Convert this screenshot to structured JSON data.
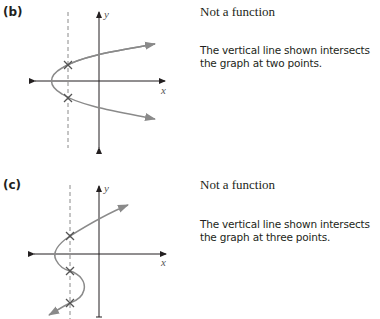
{
  "panels": [
    {
      "label": "(b)",
      "title": "Not a function",
      "description": "The vertical line shown intersects the graph at two points.",
      "axis_labels": {
        "x": "x",
        "y": "y"
      },
      "intersection_count": 2
    },
    {
      "label": "(c)",
      "title": "Not a function",
      "description": "The vertical line shown intersects the graph at three points.",
      "axis_labels": {
        "x": "x",
        "y": "y"
      },
      "intersection_count": 3
    }
  ],
  "colors": {
    "axis": "#231f20",
    "curve": "#8a8a8a",
    "dashed_line": "#8a8a8a",
    "marker": "#555555"
  }
}
